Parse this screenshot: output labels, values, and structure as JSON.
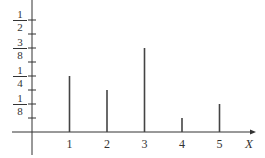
{
  "chart_data": {
    "type": "bar",
    "title": "",
    "xlabel": "X",
    "ylabel": "",
    "categories": [
      "1",
      "2",
      "3",
      "4",
      "5"
    ],
    "values": [
      0.25,
      0.1875,
      0.375,
      0.0625,
      0.125
    ],
    "values_fraction": [
      "4/16",
      "3/16",
      "6/16",
      "1/16",
      "2/16"
    ],
    "ylim": [
      0,
      0.5625
    ],
    "y_ticks": [
      0.0625,
      0.125,
      0.1875,
      0.25,
      0.3125,
      0.375,
      0.4375,
      0.5
    ],
    "y_tick_labels": [
      {
        "value": 0.125,
        "num": "1",
        "den": "8"
      },
      {
        "value": 0.25,
        "num": "1",
        "den": "4"
      },
      {
        "value": 0.375,
        "num": "3",
        "den": "8"
      },
      {
        "value": 0.5,
        "num": "1",
        "den": "2"
      }
    ],
    "grid": false,
    "legend": null,
    "style": "line-spike (probability mass function)"
  },
  "colors": {
    "axis": "#333333",
    "bar": "#444444"
  }
}
